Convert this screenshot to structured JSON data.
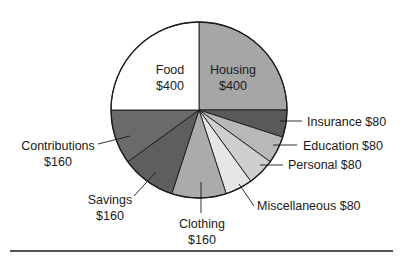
{
  "chart_data": {
    "type": "pie",
    "title": "",
    "start_angle_deg": 0,
    "direction": "clockwise",
    "total": 1600,
    "slices": [
      {
        "label": "Housing",
        "value": 400,
        "display": "$400",
        "color": "#a6a6a6"
      },
      {
        "label": "Insurance",
        "value": 80,
        "display": "$80",
        "color": "#5a5a5a"
      },
      {
        "label": "Education",
        "value": 80,
        "display": "$80",
        "color": "#b8b8b8"
      },
      {
        "label": "Personal",
        "value": 80,
        "display": "$80",
        "color": "#cfcfcf"
      },
      {
        "label": "Miscellaneous",
        "value": 80,
        "display": "$80",
        "color": "#e6e6e6"
      },
      {
        "label": "Clothing",
        "value": 160,
        "display": "$160",
        "color": "#ababab"
      },
      {
        "label": "Savings",
        "value": 160,
        "display": "$160",
        "color": "#5e5e5e"
      },
      {
        "label": "Contributions",
        "value": 160,
        "display": "$160",
        "color": "#6a6a6a"
      },
      {
        "label": "Food",
        "value": 400,
        "display": "$400",
        "color": "#ffffff"
      }
    ]
  },
  "labels": {
    "food": {
      "name": "Food",
      "amount": "$400"
    },
    "housing": {
      "name": "Housing",
      "amount": "$400"
    },
    "insurance": "Insurance $80",
    "education": "Education $80",
    "personal": "Personal $80",
    "miscellaneous": "Miscellaneous $80",
    "clothing": {
      "name": "Clothing",
      "amount": "$160"
    },
    "savings": {
      "name": "Savings",
      "amount": "$160"
    },
    "contributions": {
      "name": "Contributions",
      "amount": "$160"
    }
  }
}
